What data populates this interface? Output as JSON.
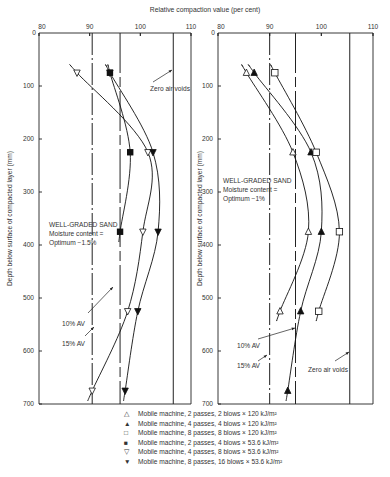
{
  "chart_data": {
    "type": "line",
    "title": "Relative compaction value (per cent)",
    "xlabel": "Relative compaction value (per cent)",
    "ylabel": "Depth below surface of compacted layer (mm)",
    "xlim": [
      80,
      110
    ],
    "ylim": [
      0,
      700
    ],
    "x_ticks": [
      80,
      90,
      100,
      110
    ],
    "y_ticks": [
      0,
      100,
      200,
      300,
      400,
      500,
      600,
      700
    ],
    "grid": false,
    "legend_position": "bottom",
    "legend": [
      {
        "symbol": "open-up-triangle",
        "glyph": "△",
        "label": "Mobile machine, 2 passes, 2 blows × 120 kJ/m²"
      },
      {
        "symbol": "filled-up-triangle",
        "glyph": "▲",
        "label": "Mobile machine, 4 passes, 4 blows × 120 kJ/m²"
      },
      {
        "symbol": "open-square",
        "glyph": "□",
        "label": "Mobile machine, 8 passes, 8 blows × 120 kJ/m²"
      },
      {
        "symbol": "filled-square",
        "glyph": "■",
        "label": "Mobile machine, 2 passes, 4 blows × 53.6 kJ/m²"
      },
      {
        "symbol": "open-down-triangle",
        "glyph": "▽",
        "label": "Mobile machine, 4 passes, 8 blows × 53.6 kJ/m²"
      },
      {
        "symbol": "filled-down-triangle",
        "glyph": "▼",
        "label": "Mobile machine, 8 passes, 16 blows × 53.6 kJ/m²"
      }
    ],
    "panels": [
      {
        "name": "left",
        "annotation": [
          "WELL-GRADED SAND",
          "Moisture content =",
          "Optimum −1.5%"
        ],
        "reference_lines": [
          {
            "label": "10% AV",
            "x": 90.5,
            "style": "dash-dot"
          },
          {
            "label": "15% AV",
            "x": 96,
            "style": "dashed"
          },
          {
            "label": "Zero air voids",
            "x": 106.5,
            "style": "solid"
          }
        ],
        "series": [
          {
            "name": "Mobile machine, 2 passes, 4 blows × 53.6 kJ/m²",
            "symbol": "filled-square",
            "points": [
              [
                94,
                75
              ],
              [
                98,
                225
              ],
              [
                96,
                375
              ]
            ]
          },
          {
            "name": "Mobile machine, 4 passes, 8 blows × 53.6 kJ/m²",
            "symbol": "open-down-triangle",
            "points": [
              [
                87.5,
                75
              ],
              [
                101.5,
                225
              ],
              [
                100.5,
                375
              ],
              [
                97.5,
                525
              ],
              [
                90.5,
                675
              ]
            ]
          },
          {
            "name": "Mobile machine, 8 passes, 16 blows × 53.6 kJ/m²",
            "symbol": "filled-down-triangle",
            "points": [
              [
                94,
                75
              ],
              [
                102.5,
                225
              ],
              [
                103.5,
                375
              ],
              [
                99.5,
                525
              ],
              [
                97,
                675
              ]
            ]
          }
        ]
      },
      {
        "name": "right",
        "annotation": [
          "WELL-GRADED SAND",
          "Moisture content =",
          "Optimum −1%"
        ],
        "reference_lines": [
          {
            "label": "10% AV",
            "x": 90,
            "style": "dash-dot"
          },
          {
            "label": "15% AV",
            "x": 95,
            "style": "dashed"
          },
          {
            "label": "Zero air voids",
            "x": 105.5,
            "style": "solid"
          }
        ],
        "series": [
          {
            "name": "Mobile machine, 2 passes, 2 blows × 120 kJ/m²",
            "symbol": "open-up-triangle",
            "points": [
              [
                85.5,
                75
              ],
              [
                94.5,
                225
              ],
              [
                97.5,
                375
              ],
              [
                92,
                525
              ]
            ]
          },
          {
            "name": "Mobile machine, 4 passes, 4 blows × 120 kJ/m²",
            "symbol": "filled-up-triangle",
            "points": [
              [
                87,
                75
              ],
              [
                98,
                225
              ],
              [
                100,
                375
              ],
              [
                96,
                525
              ],
              [
                93.5,
                675
              ]
            ]
          },
          {
            "name": "Mobile machine, 8 passes, 8 blows × 120 kJ/m²",
            "symbol": "open-square",
            "points": [
              [
                91,
                75
              ],
              [
                99,
                225
              ],
              [
                103.5,
                375
              ],
              [
                99.5,
                525
              ]
            ]
          }
        ]
      }
    ]
  },
  "labels": {
    "x_axis_title": "Relative compaction value (per cent)",
    "y_axis_title": "Depth below surface of compacted layer (mm)",
    "av10": "10% AV",
    "av15": "15% AV",
    "zav": "Zero air voids"
  }
}
